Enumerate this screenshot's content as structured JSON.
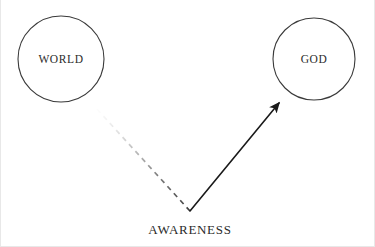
{
  "diagram": {
    "background_color": "#ffffff",
    "width": 375,
    "height": 247,
    "stroke_color": "#3a3a3a",
    "text_color": "#2b2b2b",
    "nodes": [
      {
        "id": "world",
        "label": "WORLD",
        "shape": "circle",
        "cx": 61,
        "cy": 59,
        "r": 43,
        "fill": "#ffffff",
        "stroke": "#3a3a3a"
      },
      {
        "id": "god",
        "label": "GOD",
        "shape": "circle",
        "cx": 314,
        "cy": 59,
        "r": 41,
        "fill": "#ffffff",
        "stroke": "#3a3a3a"
      }
    ],
    "edges": [
      {
        "id": "awareness-to-world",
        "style": "dashed",
        "from": {
          "x": 190,
          "y": 211
        },
        "to": {
          "x": 96,
          "y": 108
        },
        "arrowhead": false,
        "fade": "fades-out-toward-world",
        "color": "#555555"
      },
      {
        "id": "awareness-to-god",
        "style": "solid",
        "from": {
          "x": 190,
          "y": 211
        },
        "to": {
          "x": 279,
          "y": 103
        },
        "arrowhead": true,
        "color": "#1a1a1a"
      }
    ],
    "edge_label": {
      "id": "awareness",
      "label": "AWARENESS",
      "x": 190,
      "y": 234
    }
  }
}
